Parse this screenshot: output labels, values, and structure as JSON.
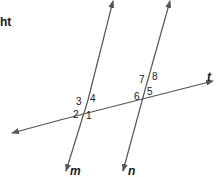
{
  "cut_text": "ht",
  "line_color": "#555555",
  "lines": {
    "transversal": {
      "label": "t"
    },
    "line_m": {
      "label": "m"
    },
    "line_n": {
      "label": "n"
    }
  },
  "angles": {
    "a1": "1",
    "a2": "2",
    "a3": "3",
    "a4": "4",
    "a5": "5",
    "a6": "6",
    "a7": "7",
    "a8": "8"
  }
}
